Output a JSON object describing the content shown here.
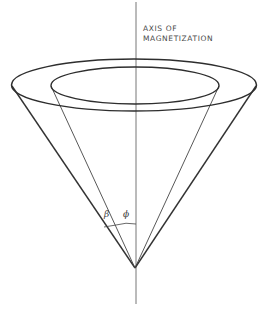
{
  "diagram": {
    "type": "cone-precession",
    "axis_label": {
      "line1": "AXIS OF",
      "line2": "MAGNETIZATION"
    },
    "angle_labels": {
      "beta": "β",
      "phi": "ϕ"
    },
    "colors": {
      "stroke": "#333333",
      "axis": "#777777",
      "background": "#ffffff"
    }
  }
}
